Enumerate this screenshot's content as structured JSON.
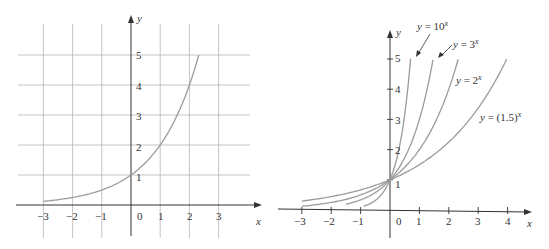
{
  "chart_data": [
    {
      "type": "line",
      "title": "",
      "xlabel": "x",
      "ylabel": "y",
      "grid": true,
      "xlim": [
        -3,
        3
      ],
      "ylim": [
        0,
        5
      ],
      "x_ticks": [
        "-3",
        "-2",
        "-1",
        "0",
        "1",
        "2",
        "3"
      ],
      "y_ticks": [
        "1",
        "2",
        "3",
        "4",
        "5"
      ],
      "series": [
        {
          "name": "y = 2^x",
          "x": [
            -3,
            -2,
            -1,
            0,
            1,
            2,
            2.32
          ],
          "values": [
            0.125,
            0.25,
            0.5,
            1,
            2,
            4,
            5
          ]
        }
      ]
    },
    {
      "type": "line",
      "title": "",
      "xlabel": "x",
      "ylabel": "y",
      "grid": false,
      "xlim": [
        -3,
        4
      ],
      "ylim": [
        0,
        5
      ],
      "x_ticks": [
        "-3",
        "-2",
        "-1",
        "0",
        "1",
        "2",
        "3",
        "4"
      ],
      "y_ticks": [
        "1",
        "2",
        "3",
        "4",
        "5"
      ],
      "series": [
        {
          "name": "y = 10^x",
          "base": 10,
          "x_range": [
            -0.9,
            0.7
          ],
          "label": "y = 10",
          "exp": "x"
        },
        {
          "name": "y = 3^x",
          "base": 3,
          "x_range": [
            -1.5,
            1.46
          ],
          "label": "y = 3",
          "exp": "x"
        },
        {
          "name": "y = 2^x",
          "base": 2,
          "x_range": [
            -3,
            2.32
          ],
          "label": "y = 2",
          "exp": "x"
        },
        {
          "name": "y = (1.5)^x",
          "base": 1.5,
          "x_range": [
            -3,
            3.97
          ],
          "label": "y = (1.5)",
          "exp": "x"
        }
      ]
    }
  ],
  "left": {
    "x_label": "x",
    "y_label": "y",
    "zero_label": "0",
    "x_tick_labels": [
      "−3",
      "−2",
      "−1",
      "1",
      "2",
      "3"
    ],
    "y_tick_labels": [
      "1",
      "2",
      "3",
      "4",
      "5"
    ]
  },
  "right": {
    "x_label": "x",
    "y_label": "y",
    "zero_label": "0",
    "x_tick_labels": [
      "−3",
      "−2",
      "−1",
      "1",
      "2",
      "3",
      "4"
    ],
    "y_tick_labels": [
      "1",
      "2",
      "3",
      "4",
      "5"
    ],
    "curve_labels": {
      "ten": "y = 10",
      "three": "y = 3",
      "two": "y = 2",
      "onehalf": "y = (1.5)",
      "exp": "x"
    }
  },
  "colors": {
    "curve": "#9a9a9a",
    "grid": "#b5b5b5",
    "axis": "#333333"
  }
}
